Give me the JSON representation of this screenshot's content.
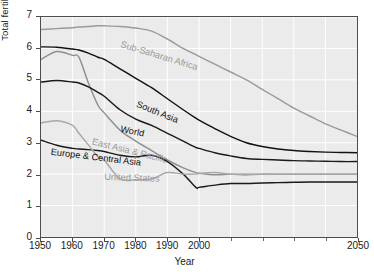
{
  "chart_data": {
    "type": "line",
    "title": "",
    "xlabel": "Year",
    "ylabel": "Total fertility (children per woman)",
    "xlim": [
      1950,
      2050
    ],
    "ylim": [
      0,
      7
    ],
    "xticks": [
      1950,
      1960,
      1970,
      1980,
      1990,
      2000,
      2050
    ],
    "xtick_labels": [
      "1950",
      "1960",
      "1970",
      "1980",
      "1990",
      "2000",
      "2050"
    ],
    "yticks": [
      0,
      1,
      2,
      3,
      4,
      5,
      6,
      7
    ],
    "ytick_labels": [
      "0",
      "1",
      "2",
      "3",
      "4",
      "5",
      "6",
      "7"
    ],
    "grid": true,
    "legend_position": "inline-annotations",
    "x": [
      1950,
      1955,
      1960,
      1962,
      1965,
      1968,
      1970,
      1975,
      1980,
      1985,
      1990,
      1995,
      1999,
      2000,
      2005,
      2010,
      2015,
      2020,
      2025,
      2030,
      2035,
      2040,
      2045,
      2050
    ],
    "series": [
      {
        "name": "Sub-Saharan Africa",
        "color": "#9a9a9a",
        "label_color": "#9a9a9a",
        "values": [
          6.6,
          6.63,
          6.66,
          6.68,
          6.7,
          6.72,
          6.72,
          6.7,
          6.65,
          6.55,
          6.3,
          6.0,
          5.8,
          5.75,
          5.5,
          5.25,
          5.0,
          4.7,
          4.4,
          4.1,
          3.85,
          3.6,
          3.4,
          3.2
        ]
      },
      {
        "name": "South Asia",
        "color": "#111111",
        "label_color": "#111111",
        "values": [
          6.05,
          6.04,
          5.98,
          5.95,
          5.85,
          5.72,
          5.65,
          5.35,
          5.05,
          4.75,
          4.4,
          4.05,
          3.78,
          3.72,
          3.45,
          3.2,
          3.0,
          2.88,
          2.8,
          2.75,
          2.72,
          2.7,
          2.69,
          2.68
        ]
      },
      {
        "name": "East Asia & Pacific",
        "color": "#8f8f8f",
        "label_color": "#8f8f8f",
        "values": [
          5.65,
          5.9,
          5.78,
          5.72,
          4.9,
          4.2,
          3.95,
          3.4,
          3.05,
          2.75,
          2.45,
          2.2,
          2.05,
          2.03,
          1.98,
          2.0,
          2.0,
          2.0,
          2.0,
          2.0,
          2.0,
          2.0,
          2.0,
          2.0
        ]
      },
      {
        "name": "World",
        "color": "#1a1a1a",
        "label_color": "#111111",
        "values": [
          4.93,
          4.98,
          4.93,
          4.9,
          4.78,
          4.6,
          4.48,
          4.05,
          3.75,
          3.55,
          3.3,
          3.05,
          2.85,
          2.82,
          2.68,
          2.58,
          2.5,
          2.47,
          2.45,
          2.43,
          2.42,
          2.41,
          2.4,
          2.4
        ]
      },
      {
        "name": "Europe & Central Asia",
        "color": "#1a1a1a",
        "label_color": "#111111",
        "values": [
          3.08,
          2.92,
          2.82,
          2.8,
          2.78,
          2.75,
          2.72,
          2.6,
          2.55,
          2.6,
          2.4,
          2.0,
          1.58,
          1.58,
          1.65,
          1.7,
          1.7,
          1.72,
          1.73,
          1.74,
          1.75,
          1.75,
          1.75,
          1.75
        ]
      },
      {
        "name": "United States",
        "color": "#a8a8a8",
        "label_color": "#a8a8a8",
        "values": [
          3.63,
          3.7,
          3.55,
          3.3,
          2.93,
          2.55,
          2.45,
          1.85,
          1.82,
          1.85,
          2.05,
          2.0,
          2.0,
          2.02,
          2.05,
          2.0,
          1.97,
          2.0,
          2.0,
          2.0,
          2.0,
          2.0,
          2.0,
          2.0
        ]
      }
    ],
    "annotations": [
      {
        "name": "sub-saharan-africa-label",
        "text": "Sub-Saharan Africa",
        "x": 1975,
        "y": 6.05,
        "rotation": 17,
        "tone": "light"
      },
      {
        "name": "south-asia-label",
        "text": "South Asia",
        "x": 1980,
        "y": 4.15,
        "rotation": 22,
        "tone": "dark"
      },
      {
        "name": "world-label",
        "text": "World",
        "x": 1975,
        "y": 3.35,
        "rotation": 12,
        "tone": "dark"
      },
      {
        "name": "east-asia-pacific-label",
        "text": "East Asia & Pacific",
        "x": 1966,
        "y": 2.95,
        "rotation": 14,
        "tone": "light"
      },
      {
        "name": "europe-central-asia-label",
        "text": "Europe & Central Asia",
        "x": 1953,
        "y": 2.62,
        "rotation": 7,
        "tone": "dark"
      },
      {
        "name": "united-states-label",
        "text": "United States",
        "x": 1970,
        "y": 1.82,
        "rotation": 2,
        "tone": "light"
      }
    ]
  },
  "axes": {
    "x_title": "Year",
    "y_title": "Total fertility (children per woman)"
  },
  "colors": {
    "plot_background": "#ebebeb",
    "grid": "#ffffff",
    "frame": "#4d4d4d",
    "dark_series": "#111111",
    "light_series": "#9a9a9a",
    "page_background": "#ffffff"
  }
}
